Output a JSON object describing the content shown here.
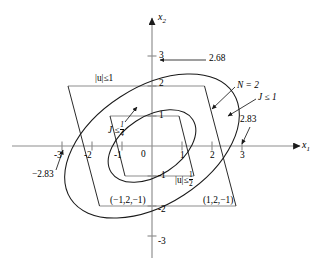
{
  "figure": {
    "type": "geometry-diagram",
    "axes": {
      "x_label": "x",
      "x_label_sub": "1",
      "y_label": "x",
      "y_label_sub": "2",
      "origin_label": "0",
      "x_ticks": [
        "-3",
        "-2",
        "-1",
        "1",
        "2",
        "3"
      ],
      "y_ticks": [
        "3",
        "2",
        "1",
        "-1",
        "-2",
        "-3"
      ],
      "x_range": [
        -3.6,
        3.6
      ],
      "y_range": [
        -3.4,
        3.4
      ],
      "unit_px": 30,
      "grid": false
    },
    "curves": [
      {
        "name": "outer-ellipse",
        "label": "J ≤ 1",
        "semi_major": 3.2,
        "semi_minor": 1.95,
        "rotation_deg": 33,
        "x_intercept": 2.83,
        "y_intercept": 2.68
      },
      {
        "name": "inner-ellipse",
        "label": "J ≤ 1/4",
        "semi_major": 1.6,
        "semi_minor": 0.975,
        "rotation_deg": 33,
        "x_intercept": 1.415,
        "y_intercept": 1.34
      }
    ],
    "polygons": [
      {
        "name": "outer-parallelogram",
        "label": "|u| ≤ 1",
        "vertices": [
          [
            -2.8,
            2
          ],
          [
            1.75,
            2
          ],
          [
            2.8,
            -2
          ],
          [
            -1.75,
            -2
          ]
        ]
      },
      {
        "name": "inner-parallelogram",
        "label": "|u| ≤ 1/2",
        "vertices": [
          [
            -1.4,
            1
          ],
          [
            0.9,
            1
          ],
          [
            1.4,
            -1
          ],
          [
            -0.9,
            -1
          ]
        ]
      }
    ],
    "annotations": {
      "top_value": "2.68",
      "right_value": "2.83",
      "left_value": "−2.83",
      "n_label_text": "N = 2",
      "j_outer_text": "J ≤ 1",
      "j_inner_text_lead": "J ≤",
      "j_inner_frac_num": "1",
      "j_inner_frac_den": "4",
      "u_outer_text": "|u|≤1",
      "u_inner_text_lead": "|u|≤",
      "u_inner_frac_num": "1",
      "u_inner_frac_den": "2",
      "vertex_left": "(−1,2,−1)",
      "vertex_right": "(1,2,−1)"
    },
    "colors": {
      "axis": "#8d8d8d",
      "curve": "#1a1a1a",
      "polygon": "#2b2b2b",
      "background": "#ffffff"
    }
  }
}
